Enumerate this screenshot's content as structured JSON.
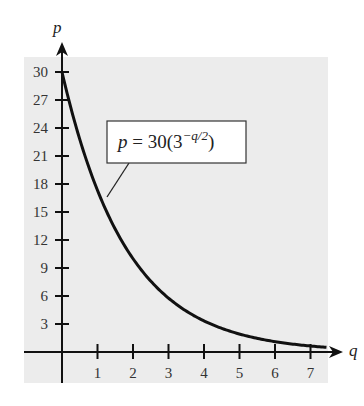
{
  "chart_data": {
    "type": "line",
    "title": "",
    "xlabel": "q",
    "ylabel": "p",
    "function": "p = 30(3^(-q/2))",
    "x_ticks": [
      1,
      2,
      3,
      4,
      5,
      6,
      7
    ],
    "y_ticks": [
      3,
      6,
      9,
      12,
      15,
      18,
      21,
      24,
      27,
      30
    ],
    "xlim": [
      0,
      7.5
    ],
    "ylim": [
      0,
      30
    ],
    "grid": false,
    "background": "#ececec",
    "series": [
      {
        "name": "p = 30(3^-q/2)",
        "x": [
          0,
          0.5,
          1,
          1.5,
          2,
          2.5,
          3,
          3.5,
          4,
          4.5,
          5,
          5.5,
          6,
          6.5,
          7,
          7.45
        ],
        "y": [
          30,
          22.8,
          17.32,
          13.16,
          10,
          7.6,
          5.77,
          4.39,
          3.33,
          2.53,
          1.92,
          1.46,
          1.11,
          0.84,
          0.64,
          0.52
        ]
      }
    ],
    "annotation": {
      "lhs": "p",
      "eq": " = 30(3",
      "exponent": "−q/2",
      "close": ")"
    }
  }
}
